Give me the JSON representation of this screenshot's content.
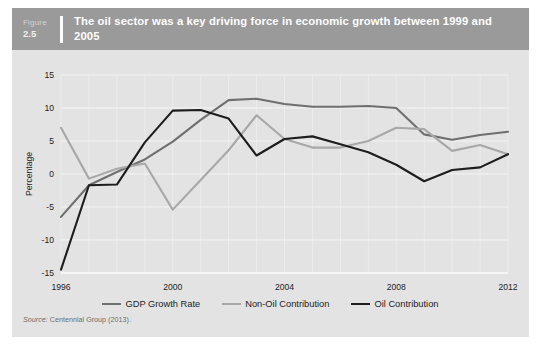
{
  "figure": {
    "label_word": "Figure",
    "number": "2.5",
    "title": "The oil sector was a key driving force in economic growth between 1999 and 2005"
  },
  "source": {
    "prefix": "Source:",
    "text": " Centennial Group (2013)."
  },
  "colors": {
    "card_background": "#e3e3e3",
    "header_background": "#9a9a9a",
    "plot_background": "#e3e3e3",
    "gridline": "#f4f4f4",
    "gdp_growth_rate": "#6f6f6f",
    "non_oil_contribution": "#a8a8a8",
    "oil_contribution": "#1d1d1d",
    "text": "#1d1d1d"
  },
  "chart_data": {
    "type": "line",
    "title": "The oil sector was a key driving force in economic growth between 1999 and 2005",
    "xlabel": "",
    "ylabel": "Percentage",
    "xlim": [
      1996,
      2012
    ],
    "ylim": [
      -15,
      15
    ],
    "yticks": [
      15,
      10,
      5,
      0,
      -5,
      -10,
      -15
    ],
    "xticks": [
      1996,
      2000,
      2004,
      2008,
      2012
    ],
    "xtick_labels": [
      "1996",
      "2000",
      "2004",
      "2008",
      "2012"
    ],
    "ytick_labels": [
      "15",
      "10",
      "5",
      "0",
      "-5",
      "-10",
      "-15"
    ],
    "grid": true,
    "legend_position": "bottom",
    "x": [
      1996,
      1997,
      1998,
      1999,
      2000,
      2001,
      2002,
      2003,
      2004,
      2005,
      2006,
      2007,
      2008,
      2009,
      2010,
      2011,
      2012
    ],
    "series": [
      {
        "name": "GDP Growth Rate",
        "color": "#6f6f6f",
        "values": [
          -6.5,
          -1.7,
          0.3,
          2.2,
          4.9,
          8.2,
          11.2,
          11.4,
          10.6,
          10.2,
          10.2,
          10.3,
          10.0,
          6.0,
          5.2,
          5.9,
          6.4
        ]
      },
      {
        "name": "Non-Oil Contribution",
        "color": "#a8a8a8",
        "values": [
          7.0,
          -0.7,
          0.8,
          1.6,
          -5.4,
          -0.9,
          3.6,
          8.9,
          5.3,
          4.0,
          4.0,
          5.0,
          7.0,
          6.8,
          3.5,
          4.4,
          3.0
        ]
      },
      {
        "name": "Oil Contribution",
        "color": "#1d1d1d",
        "values": [
          -14.5,
          -1.7,
          -1.6,
          4.8,
          9.6,
          9.7,
          8.4,
          2.8,
          5.3,
          5.7,
          4.5,
          3.3,
          1.4,
          -1.1,
          0.6,
          1.0,
          3.0
        ]
      }
    ]
  },
  "legend": {
    "entries": [
      {
        "label": "GDP Growth Rate",
        "color": "#6f6f6f"
      },
      {
        "label": "Non-Oil Contribution",
        "color": "#a8a8a8"
      },
      {
        "label": "Oil Contribution",
        "color": "#1d1d1d"
      }
    ]
  }
}
